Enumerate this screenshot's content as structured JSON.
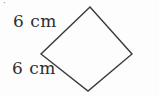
{
  "figure": {
    "type": "geometry-diagram",
    "shape": {
      "name": "rhombus",
      "points": "90,7 132,54 88,91 41,54",
      "stroke_color": "#3a3a3a"
    },
    "labels": {
      "top_side": "6 cm",
      "bottom_side": "6 cm"
    },
    "corner_mark": "·",
    "colors": {
      "background": "#fdfdfd",
      "text": "#2e2e2e"
    }
  }
}
